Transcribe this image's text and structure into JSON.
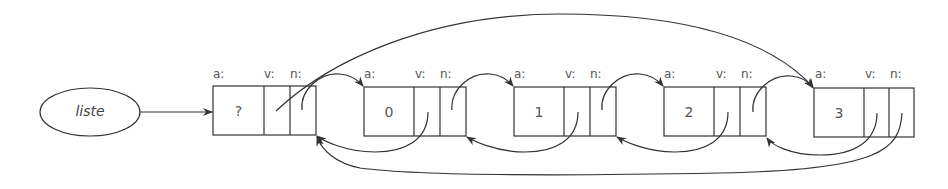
{
  "diagram": {
    "title": "",
    "head": {
      "label": "liste"
    },
    "field_labels": {
      "a": "a:",
      "v": "v:",
      "n": "n:"
    },
    "nodes": [
      {
        "id": "sentinel",
        "value": "?"
      },
      {
        "id": "node0",
        "value": "0"
      },
      {
        "id": "node1",
        "value": "1"
      },
      {
        "id": "node2",
        "value": "2"
      },
      {
        "id": "node3",
        "value": "3"
      }
    ],
    "colors": {
      "stroke": "#333333",
      "text": "#555555",
      "background": "#ffffff"
    }
  }
}
